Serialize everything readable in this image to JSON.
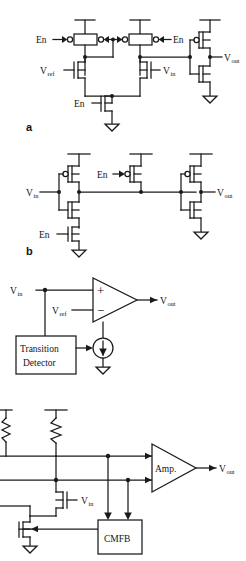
{
  "figure": {
    "kind": "circuit-schematic-sheet",
    "width": 246,
    "height": 561,
    "background": "#ffffff",
    "line_color": "#1a1a1a",
    "panel_count": 4
  },
  "panels": [
    {
      "id": "a",
      "id_label": "a",
      "title": "clocked differential comparator stage",
      "labels": {
        "en_left": "En",
        "en_right": "En",
        "en_tail": "En",
        "vref": "V",
        "vref_sub": "ref",
        "vin": "V",
        "vin_sub": "in",
        "vout": "V",
        "vout_sub": "out"
      }
    },
    {
      "id": "b",
      "id_label": "b",
      "title": "tri-state inverter chain",
      "labels": {
        "vin": "V",
        "vin_sub": "in",
        "en_top": "En",
        "en_bottom": "En",
        "en_mid": "En",
        "vout": "V",
        "vout_sub": "out"
      }
    },
    {
      "id": "c",
      "id_label": "",
      "title": "comparator with transition detector biased current source",
      "labels": {
        "vin": "V",
        "vin_sub": "in",
        "vref": "V",
        "vref_sub": "ref",
        "vout": "V",
        "vout_sub": "out",
        "plus": "+",
        "minus": "−",
        "block_line1": "Transition",
        "block_line2": "Detector"
      }
    },
    {
      "id": "d",
      "id_label": "",
      "title": "differential amplifier with common mode feedback",
      "labels": {
        "amp": "Amp.",
        "vin": "V",
        "vin_sub": "in",
        "vout": "V",
        "vout_sub": "out",
        "cmfb": "CMFB"
      }
    }
  ]
}
